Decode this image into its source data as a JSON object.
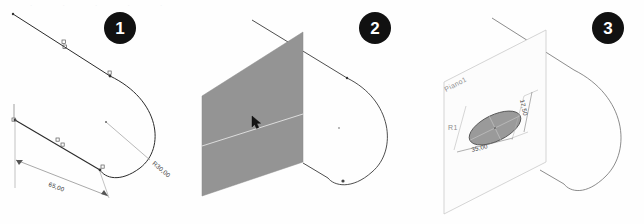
{
  "figure": {
    "type": "cad-tutorial-steps",
    "language": "it",
    "background_color": "#fefefe",
    "badge_color": "#111111",
    "badge_text_color": "#ffffff",
    "plane_fill_color": "#949494",
    "ellipse_fill_color": "#9a9a9a",
    "geometry_line_color": "#2b2b2b",
    "dimension_line_color": "#4a4a4a",
    "construction_line_color": "#b9b9b9"
  },
  "steps": [
    {
      "number": "1",
      "caption_badge": "1"
    },
    {
      "number": "2",
      "caption_badge": "2"
    },
    {
      "number": "3",
      "caption_badge": "3"
    }
  ],
  "panel1": {
    "name": "sketch-profile-with-dimensions",
    "dimensions": [
      {
        "name": "length-dimension",
        "value": "65,00"
      },
      {
        "name": "radius-dimension",
        "value": "R30,00"
      }
    ],
    "constraint_markers": 5
  },
  "panel2": {
    "name": "plane-inserted-with-cursor",
    "plane_label": "",
    "cursor": "arrow-cursor"
  },
  "panel3": {
    "name": "plane-with-ellipse-sketch",
    "plane_label": "Piano1",
    "dimensions": [
      {
        "name": "ellipse-major-dimension",
        "value": "35,00"
      },
      {
        "name": "ellipse-minor-dimension",
        "value": "17,50"
      }
    ],
    "origin_marker": "R1"
  },
  "bleed_through": {
    "top": ". . . . .",
    "middle": "",
    "bottom": "",
    "bottom2": "",
    "left": ""
  }
}
